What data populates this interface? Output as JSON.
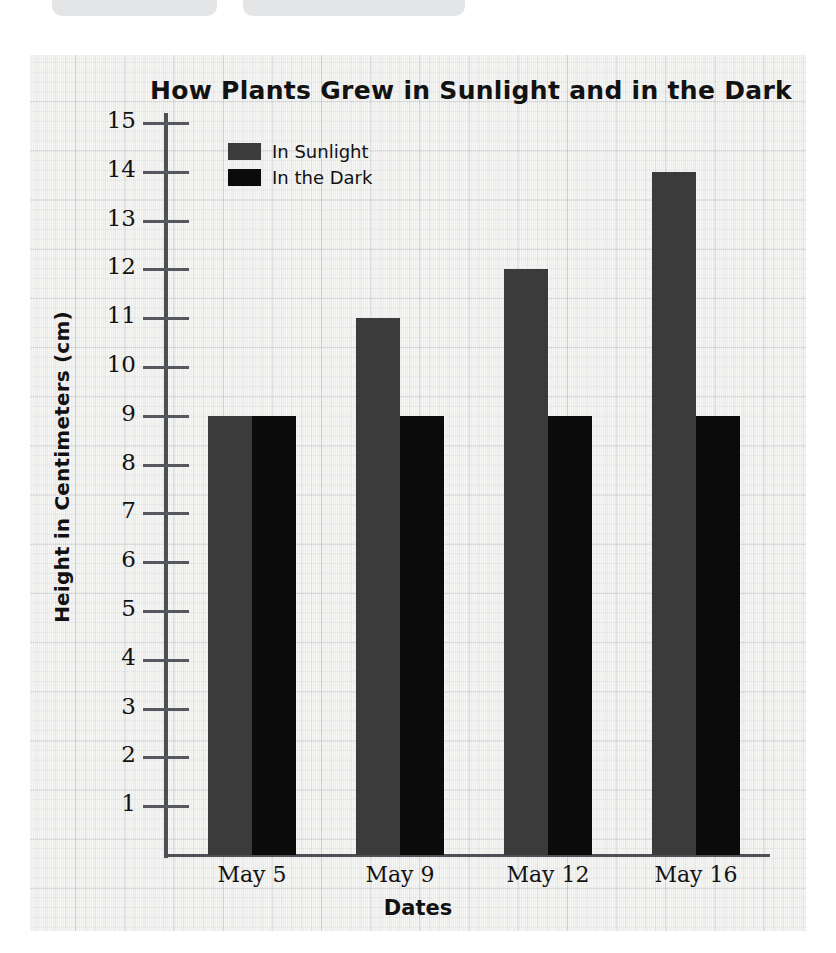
{
  "top_chips": [
    {
      "name": "chip-left",
      "label": ""
    },
    {
      "name": "chip-right",
      "label": ""
    }
  ],
  "chart_data": {
    "type": "bar",
    "title": "How Plants Grew in Sunlight and in the Dark",
    "xlabel": "Dates",
    "ylabel": "Height in Centimeters (cm)",
    "categories": [
      "May 5",
      "May 9",
      "May 12",
      "May 16"
    ],
    "series": [
      {
        "name": "In Sunlight",
        "color": "#3b3b3c",
        "values": [
          9,
          11,
          12,
          14
        ]
      },
      {
        "name": "In the Dark",
        "color": "#0b0b0c",
        "values": [
          9,
          9,
          9,
          9
        ]
      }
    ],
    "ylim": [
      0,
      15
    ],
    "yticks": [
      15,
      14,
      13,
      12,
      11,
      10,
      9,
      8,
      7,
      6,
      5,
      4,
      3,
      2,
      1
    ],
    "ytick_labels": [
      "15",
      "14",
      "13",
      "12",
      "11",
      "10",
      "9",
      "8",
      "7",
      "6",
      "5",
      "4",
      "3",
      "2",
      "1"
    ],
    "grid": true,
    "legend_position": "top-left",
    "background": "graph-paper"
  }
}
